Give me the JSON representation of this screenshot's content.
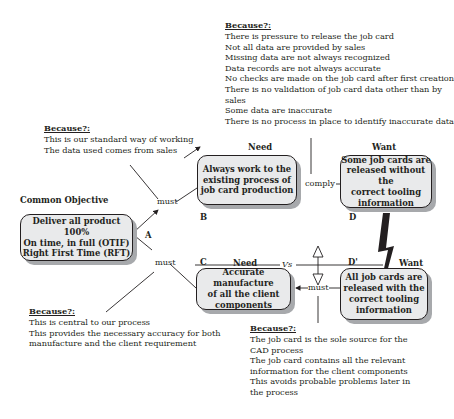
{
  "diagram": {
    "type": "evaporating-cloud",
    "objective": {
      "heading": "Common Objective",
      "lines": [
        "Deliver all product 100%",
        "On time, in full (OTIF)",
        "Right First Time (RFT)"
      ],
      "letter": "A"
    },
    "need_b": {
      "heading": "Need",
      "lines": [
        "Always work to the",
        "existing process of",
        "job card production"
      ],
      "letter": "B"
    },
    "need_c": {
      "heading": "Need",
      "lines": [
        "Accurate manufacture",
        "of all the client",
        "components"
      ],
      "letter": "C"
    },
    "want_d": {
      "heading": "Want",
      "lines": [
        "Some job cards are",
        "released without the",
        "correct tooling",
        "information"
      ],
      "letter": "D"
    },
    "want_d_prime": {
      "heading": "Want",
      "lines": [
        "All job cards are",
        "released with the",
        "correct tooling",
        "information"
      ],
      "letter": "D'"
    },
    "connectors": {
      "must_ab": "must",
      "must_ac": "must",
      "comply": "comply",
      "must_cd": "must",
      "vs": "Vs"
    },
    "because_ab": {
      "heading": "Because?:",
      "lines": [
        "This is our standard way of working",
        "The data used comes from sales"
      ]
    },
    "because_bd": {
      "heading": "Because?:",
      "lines": [
        "There is pressure to release the job card",
        "Not all data are provided by sales",
        "Missing data are not always recognized",
        "Data records are not always accurate",
        "No checks are made on the job card after first creation",
        "There is no validation of job card data other than by",
        "sales",
        "Some data are inaccurate",
        "There is no process in place to identify inaccurate data"
      ]
    },
    "because_ac": {
      "heading": "Because?:",
      "lines": [
        "This is central to our process",
        "This provides the necessary accuracy for both",
        "manufacture and the client requirement"
      ]
    },
    "because_cd": {
      "heading": "Because?:",
      "lines": [
        "The job card is the sole source for the",
        "CAD process",
        "The job card contains all the relevant",
        "information for the client components",
        "This avoids probable problems later in",
        "the process"
      ]
    },
    "colors": {
      "box_fill": "#e9eaeb",
      "shadow": "#a7a9ac",
      "ink": "#231f20"
    }
  }
}
